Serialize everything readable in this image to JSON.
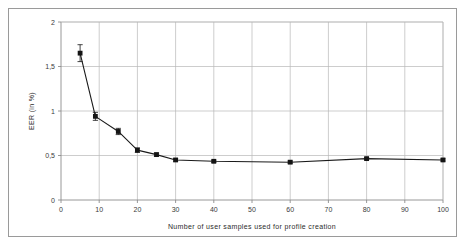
{
  "chart_data": {
    "type": "line",
    "title": "",
    "xlabel": "Number of user samples used for profile creation",
    "ylabel": "EER (in %)",
    "xlim": [
      0,
      100
    ],
    "ylim": [
      0,
      2
    ],
    "grid": true,
    "legend": "none",
    "xticks": [
      0,
      10,
      20,
      30,
      40,
      50,
      60,
      70,
      80,
      90,
      100
    ],
    "xtick_labels": [
      "0",
      "10",
      "20",
      "30",
      "40",
      "50",
      "60",
      "70",
      "80",
      "90",
      "100"
    ],
    "yticks": [
      0,
      0.5,
      1,
      1.5,
      2
    ],
    "ytick_labels": [
      "0",
      "0,5",
      "1",
      "1,5",
      "2"
    ],
    "x": [
      5,
      9,
      15,
      20,
      25,
      30,
      40,
      60,
      80,
      100
    ],
    "values": [
      1.65,
      0.94,
      0.77,
      0.56,
      0.51,
      0.45,
      0.435,
      0.425,
      0.465,
      0.45
    ],
    "yerr": [
      0.095,
      0.045,
      0.035,
      0.025,
      0.018,
      0.014,
      0.012,
      0.012,
      0.013,
      0.012
    ],
    "series": [
      {
        "name": "EER",
        "marker": "square",
        "color": "#1a1a1a",
        "x": [
          5,
          9,
          15,
          20,
          25,
          30,
          40,
          60,
          80,
          100
        ],
        "values": [
          1.65,
          0.94,
          0.77,
          0.56,
          0.51,
          0.45,
          0.435,
          0.425,
          0.465,
          0.45
        ],
        "yerr": [
          0.095,
          0.045,
          0.035,
          0.025,
          0.018,
          0.014,
          0.012,
          0.012,
          0.013,
          0.012
        ]
      }
    ],
    "colors": {
      "line": "#1a1a1a",
      "marker": "#141414",
      "grid": "#b8b8b8",
      "axis": "#8c8c8c",
      "frame": "#9a9a9a",
      "text": "#3a3a3a"
    }
  }
}
